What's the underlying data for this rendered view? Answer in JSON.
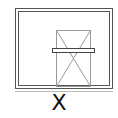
{
  "diagram": {
    "type": "cad-symbol",
    "label": "X",
    "colors": {
      "outer_frame": "#555555",
      "inner_lines": "#9a9a9a",
      "crossbar": "#444444",
      "label": "#111111",
      "background": "#ffffff"
    }
  }
}
